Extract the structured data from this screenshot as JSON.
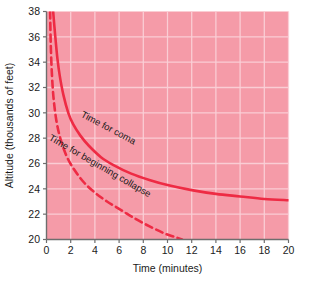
{
  "chart_data": {
    "type": "line",
    "title": "",
    "xlabel": "Time (minutes)",
    "ylabel": "Altitude (thousands of feet)",
    "xlim": [
      0,
      20
    ],
    "ylim": [
      20,
      38
    ],
    "xticks": [
      0,
      2,
      4,
      6,
      8,
      10,
      12,
      14,
      16,
      18,
      20
    ],
    "xtick_labels": [
      "0",
      "2",
      "4",
      "6",
      "8",
      "10",
      "12",
      "14",
      "16",
      "18",
      "20"
    ],
    "yticks": [
      20,
      22,
      24,
      26,
      28,
      30,
      32,
      34,
      36,
      38
    ],
    "ytick_labels": [
      "20",
      "22",
      "24",
      "26",
      "28",
      "30",
      "32",
      "34",
      "36",
      "38"
    ],
    "grid": true,
    "grid_color": "#FBD0D7",
    "plot_background": "#F59BA8",
    "page_background": "#FFFFFF",
    "axis_color": "#6E6E6E",
    "series": [
      {
        "name": "Time for coma",
        "style": "solid",
        "color": "#EE2B44",
        "label": "Time for coma",
        "label_x": 5.0,
        "label_y": 28.6,
        "label_rotation": 28,
        "x": [
          0.55,
          0.7,
          0.9,
          1.1,
          1.4,
          1.8,
          2.2,
          2.8,
          3.5,
          4.5,
          5.5,
          7.0,
          8.5,
          10.0,
          12.0,
          14.0,
          16.0,
          18.0,
          20.0
        ],
        "y": [
          38.0,
          36.3,
          34.3,
          32.9,
          31.4,
          30.0,
          29.1,
          28.2,
          27.4,
          26.5,
          25.9,
          25.2,
          24.7,
          24.3,
          23.9,
          23.6,
          23.4,
          23.2,
          23.1
        ]
      },
      {
        "name": "Time for beginning collapse",
        "style": "dashed",
        "color": "#EE2B44",
        "label": "Time for beginning collapse",
        "label_x": 4.3,
        "label_y": 25.6,
        "label_rotation": 30,
        "x": [
          0.3,
          0.35,
          0.45,
          0.6,
          0.85,
          1.2,
          1.7,
          2.3,
          3.1,
          4.0,
          5.0,
          6.2,
          7.4,
          8.6,
          9.7,
          10.6,
          11.2
        ],
        "y": [
          38.0,
          35.5,
          33.0,
          31.0,
          29.2,
          27.8,
          26.5,
          25.5,
          24.5,
          23.7,
          23.0,
          22.3,
          21.6,
          21.0,
          20.5,
          20.2,
          20.0
        ]
      }
    ]
  }
}
